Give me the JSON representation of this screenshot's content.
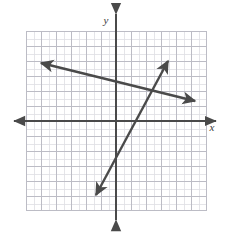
{
  "figure": {
    "kind": "coordinate-plane-graph",
    "width": 231,
    "height": 232,
    "background_color": "#ffffff"
  },
  "grid": {
    "left": 26,
    "top": 31,
    "right": 206,
    "bottom": 210,
    "major_cell_px": 15,
    "minor_per_major": 2,
    "major_color": "#b9b9c2",
    "minor_color": "#dcdce2",
    "border_color": "#b9b9c2",
    "columns": 12,
    "rows": 12
  },
  "axes": {
    "color": "#4a4a4a",
    "stroke_width": 2,
    "x_axis": {
      "label": "x",
      "label_x": 212,
      "label_y": 131,
      "y_px": 121,
      "start_x": 14,
      "end_x": 216,
      "arrow_left": true,
      "arrow_right": true
    },
    "y_axis": {
      "label": "y",
      "label_x": 106,
      "label_y": 24,
      "x_px": 116,
      "start_y": 14,
      "end_y": 220,
      "arrow_up": true,
      "arrow_down": true
    },
    "origin": {
      "x": 116,
      "y": 121
    }
  },
  "lines": [
    {
      "name": "shallow-negative-slope-line",
      "color": "#4a4a4a",
      "stroke_width": 2.4,
      "arrow_start": true,
      "arrow_end": true,
      "x1": 41,
      "y1": 63,
      "x2": 195,
      "y2": 101,
      "description": "line with small negative slope crossing from upper-left to right"
    },
    {
      "name": "steep-positive-slope-line",
      "color": "#4a4a4a",
      "stroke_width": 2.4,
      "arrow_start": true,
      "arrow_end": true,
      "x1": 96,
      "y1": 195,
      "x2": 168,
      "y2": 61,
      "description": "line with steep positive slope from lower-left to upper-right"
    }
  ]
}
